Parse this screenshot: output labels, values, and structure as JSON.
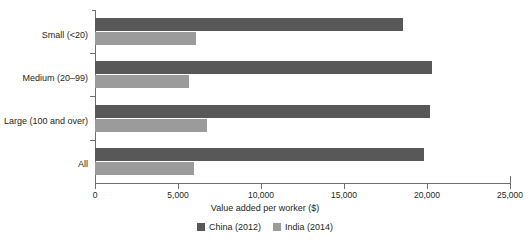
{
  "chart_data": {
    "type": "bar",
    "orientation": "horizontal",
    "title": "",
    "xlabel": "Value added per worker ($)",
    "ylabel": "",
    "xlim": [
      0,
      25000
    ],
    "grid": false,
    "legend_position": "bottom-center",
    "categories": [
      "Small (<20)",
      "Medium (20–99)",
      "Large (100 and over)",
      "All"
    ],
    "xticks": [
      0,
      5000,
      10000,
      15000,
      20000,
      25000
    ],
    "xtick_labels": [
      "0",
      "5,000",
      "10,000",
      "15,000",
      "20,000",
      "25,000"
    ],
    "series": [
      {
        "name": "China (2012)",
        "color": "#585858",
        "values": [
          18550,
          20300,
          20200,
          19800
        ]
      },
      {
        "name": "India (2014)",
        "color": "#9b9b9b",
        "values": [
          6080,
          5660,
          6750,
          5960
        ]
      }
    ]
  },
  "axis": {
    "title": "Value added per worker ($)"
  },
  "legend": {
    "items": [
      {
        "label": "China (2012)"
      },
      {
        "label": "India (2014)"
      }
    ]
  }
}
